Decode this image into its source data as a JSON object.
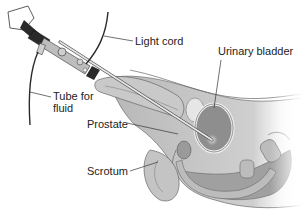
{
  "diagram": {
    "style": "grayscale medical illustration",
    "labels": [
      {
        "id": "light-cord",
        "text": "Light cord",
        "x": 135,
        "y": 36
      },
      {
        "id": "urinary-bladder",
        "text": "Urinary bladder",
        "x": 218,
        "y": 46
      },
      {
        "id": "tube-for-fluid-line1",
        "text": "Tube for",
        "x": 53,
        "y": 91
      },
      {
        "id": "tube-for-fluid-line2",
        "text": "fluid",
        "x": 53,
        "y": 103
      },
      {
        "id": "prostate",
        "text": "Prostate",
        "x": 87,
        "y": 116
      },
      {
        "id": "scrotum",
        "text": "Scrotum",
        "x": 87,
        "y": 164
      }
    ],
    "colors": {
      "background": "#ffffff",
      "text": "#222222",
      "leader_line": "#333333",
      "tissue_light": "#d9d9d9",
      "tissue_mid": "#a8a8a8",
      "tissue_dark": "#6e6e6e",
      "instrument_dark": "#2a2a2a",
      "instrument_metal": "#bdbdbd"
    }
  }
}
